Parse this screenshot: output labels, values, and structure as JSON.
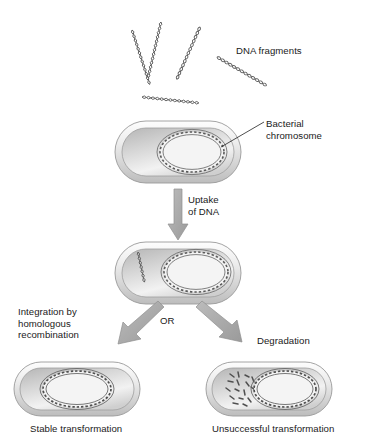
{
  "diagram": {
    "background_color": "#ffffff",
    "labels": {
      "dna_fragments": "DNA fragments",
      "bacterial_chromosome": "Bacterial\nchromosome",
      "uptake_of_dna": "Uptake\nof DNA",
      "or": "OR",
      "integration": "Integration by\nhomologous\nrecombination",
      "degradation": "Degradation",
      "stable_transformation": "Stable transformation",
      "unsuccessful_transformation": "Unsuccessful transformation"
    },
    "colors": {
      "cell_rim_light": "#f0f0f0",
      "cell_rim_mid": "#c8c8c8",
      "cell_interior_light": "#fbfbfb",
      "cell_interior_mid": "#d2d2d2",
      "cell_outline": "#8c8c8c",
      "dna_stroke": "#555555",
      "arrow_fill": "#a8a8a8",
      "arrow_stroke": "#8f8f8f",
      "leader_line": "#222222",
      "text": "#1a1a1a"
    },
    "free_dna_fragments": [
      {
        "id": "fragment-1",
        "x": 132,
        "y": 30,
        "angle": -72,
        "length": 62
      },
      {
        "id": "fragment-2",
        "x": 160,
        "y": 22,
        "angle": -103,
        "length": 58
      },
      {
        "id": "fragment-3",
        "x": 197,
        "y": 25,
        "angle": -114,
        "length": 62
      },
      {
        "id": "fragment-4",
        "x": 220,
        "y": 57,
        "angle": -150,
        "length": 60
      },
      {
        "id": "fragment-5",
        "x": 142,
        "y": 97,
        "angle": -174,
        "length": 58
      }
    ],
    "cells": [
      {
        "id": "cell-donor-recipient",
        "name": "recipient-cell-before-uptake",
        "x": 115,
        "y": 121,
        "width": 126,
        "height": 62,
        "chromosome": {
          "cx": 192,
          "cy": 152,
          "rx": 32,
          "ry": 20
        },
        "contents": [
          "bacterial-chromosome"
        ]
      },
      {
        "id": "cell-after-uptake",
        "name": "recipient-cell-after-uptake",
        "x": 115,
        "y": 242,
        "width": 126,
        "height": 62,
        "chromosome": {
          "cx": 196,
          "cy": 272,
          "rx": 32,
          "ry": 20
        },
        "contents": [
          "bacterial-chromosome",
          "internalized-dna-fragment"
        ]
      },
      {
        "id": "cell-stable",
        "name": "stable-transformation-cell",
        "x": 14,
        "y": 362,
        "width": 126,
        "height": 54,
        "chromosome": {
          "cx": 77,
          "cy": 389,
          "rx": 34,
          "ry": 18
        },
        "contents": [
          "recombinant-chromosome"
        ]
      },
      {
        "id": "cell-unsuccessful",
        "name": "unsuccessful-transformation-cell",
        "x": 206,
        "y": 362,
        "width": 126,
        "height": 54,
        "chromosome": {
          "cx": 285,
          "cy": 389,
          "rx": 31,
          "ry": 18
        },
        "contents": [
          "bacterial-chromosome",
          "degraded-dna-pieces"
        ]
      }
    ],
    "arrows": [
      {
        "id": "arrow-uptake",
        "from": [
          178,
          190
        ],
        "to": [
          178,
          238
        ],
        "direction": "down"
      },
      {
        "id": "arrow-integration",
        "from": [
          160,
          300
        ],
        "to": [
          112,
          342
        ],
        "direction": "down-left"
      },
      {
        "id": "arrow-degradation",
        "from": [
          200,
          300
        ],
        "to": [
          248,
          338
        ],
        "direction": "down-right"
      }
    ],
    "leader_lines": [
      {
        "id": "leader-bacterial-chromosome",
        "from": [
          264,
          122
        ],
        "to": [
          221,
          147
        ]
      }
    ]
  }
}
